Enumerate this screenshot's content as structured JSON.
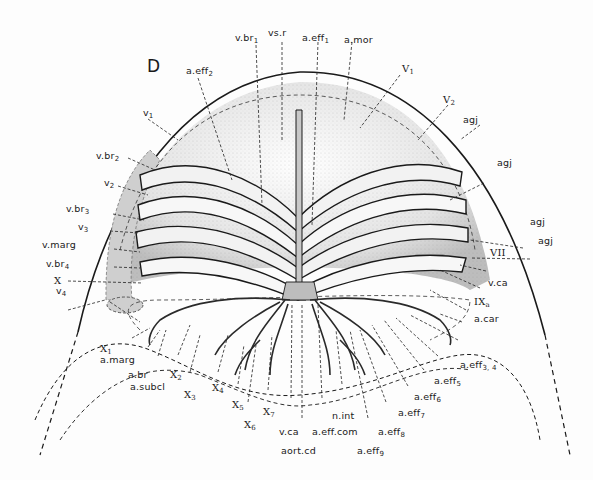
{
  "figure": {
    "panel_label": "D",
    "labels": {
      "top": [
        {
          "id": "v_br1",
          "text": "v.br",
          "sub": "1"
        },
        {
          "id": "vs_r",
          "text": "vs.r",
          "sub": ""
        },
        {
          "id": "a_eff1",
          "text": "a.eff",
          "sub": "1"
        },
        {
          "id": "a_mor",
          "text": "a.mor",
          "sub": ""
        },
        {
          "id": "a_eff2",
          "text": "a.eff",
          "sub": "2"
        }
      ],
      "left": [
        {
          "id": "v1",
          "text": "v",
          "sub": "1"
        },
        {
          "id": "v_br2",
          "text": "v.br",
          "sub": "2"
        },
        {
          "id": "v2",
          "text": "v",
          "sub": "2"
        },
        {
          "id": "v_br3",
          "text": "v.br",
          "sub": "3"
        },
        {
          "id": "v3",
          "text": "v",
          "sub": "3"
        },
        {
          "id": "v_marg",
          "text": "v.marg",
          "sub": ""
        },
        {
          "id": "v_br4",
          "text": "v.br",
          "sub": "4"
        },
        {
          "id": "v4",
          "text": "v",
          "sub": "4"
        },
        {
          "id": "X",
          "text": "X",
          "sub": ""
        },
        {
          "id": "X1",
          "text": "X",
          "sub": "1"
        }
      ],
      "right": [
        {
          "id": "V1",
          "text": "V",
          "sub": "1"
        },
        {
          "id": "V2",
          "text": "V",
          "sub": "2"
        },
        {
          "id": "agj1",
          "text": "agj",
          "sub": ""
        },
        {
          "id": "agj2",
          "text": "agj",
          "sub": ""
        },
        {
          "id": "agj3",
          "text": "agj",
          "sub": ""
        },
        {
          "id": "agj4",
          "text": "agj",
          "sub": ""
        },
        {
          "id": "VII",
          "text": "VII",
          "sub": ""
        },
        {
          "id": "v_ca_r",
          "text": "v.ca",
          "sub": ""
        },
        {
          "id": "IXa",
          "text": "IX",
          "sub": "a"
        },
        {
          "id": "a_car",
          "text": "a.car",
          "sub": ""
        }
      ],
      "bottom": [
        {
          "id": "a_marg",
          "text": "a.marg",
          "sub": ""
        },
        {
          "id": "a_br",
          "text": "a.br",
          "sub": ""
        },
        {
          "id": "a_subcl",
          "text": "a.subcl",
          "sub": ""
        },
        {
          "id": "X2",
          "text": "X",
          "sub": "2"
        },
        {
          "id": "X3",
          "text": "X",
          "sub": "3"
        },
        {
          "id": "X4",
          "text": "X",
          "sub": "4"
        },
        {
          "id": "X5",
          "text": "X",
          "sub": "5"
        },
        {
          "id": "X6",
          "text": "X",
          "sub": "6"
        },
        {
          "id": "X7",
          "text": "X",
          "sub": "7"
        },
        {
          "id": "v_ca_b",
          "text": "v.ca",
          "sub": ""
        },
        {
          "id": "aort_cd",
          "text": "aort.cd",
          "sub": ""
        },
        {
          "id": "a_eff_com",
          "text": "a.eff.com",
          "sub": ""
        },
        {
          "id": "n_int",
          "text": "n.int",
          "sub": ""
        },
        {
          "id": "a_eff9",
          "text": "a.eff",
          "sub": "9"
        },
        {
          "id": "a_eff8",
          "text": "a.eff",
          "sub": "8"
        },
        {
          "id": "a_eff7",
          "text": "a.eff",
          "sub": "7"
        },
        {
          "id": "a_eff6",
          "text": "a.eff",
          "sub": "6"
        },
        {
          "id": "a_eff5",
          "text": "a.eff",
          "sub": "5"
        },
        {
          "id": "a_eff34",
          "text": "a.eff",
          "sub": "3, 4"
        }
      ]
    },
    "colors": {
      "ink": "#1a1a1a",
      "shade": "#cfcfcf",
      "stipple": "#bdbdbd",
      "paper": "#fdfdfd"
    }
  }
}
